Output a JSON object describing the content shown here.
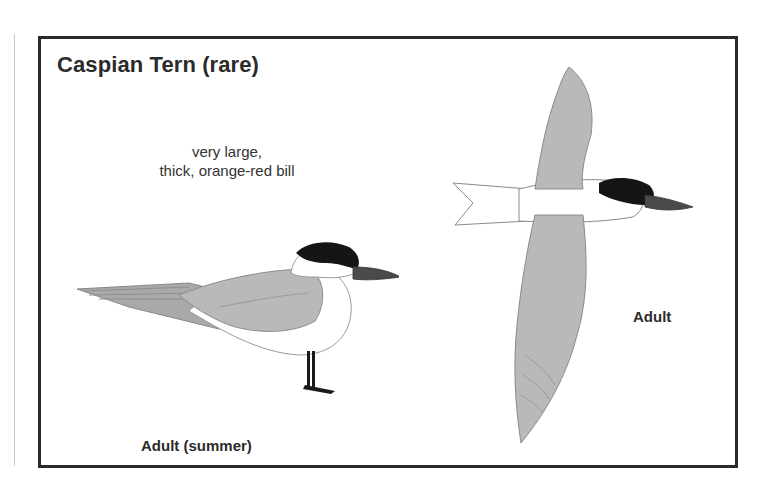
{
  "plate": {
    "title": "Caspian Tern (rare)",
    "field_note": {
      "line1": "very large,",
      "line2": "thick, orange-red bill"
    },
    "figures": [
      {
        "id": "perched",
        "caption": "Adult (summer)",
        "pose": "standing, side view"
      },
      {
        "id": "flying",
        "caption": "Adult",
        "pose": "in flight, viewed from above"
      }
    ]
  },
  "colors": {
    "frame": "#2a2a2a",
    "cap": "#151515",
    "bill": "#4a4a4a",
    "wing": "#b9b9b9",
    "body": "#ffffff",
    "text": "#2b2b2b"
  }
}
